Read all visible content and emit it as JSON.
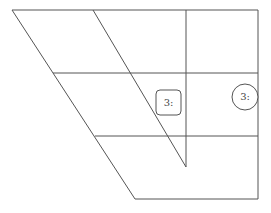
{
  "diagram": {
    "stroke_color": "#555555",
    "nodes": [
      {
        "id": "square-node",
        "shape": "rounded-square",
        "label": "3:"
      },
      {
        "id": "circle-node",
        "shape": "circle",
        "label": "3:"
      }
    ]
  }
}
